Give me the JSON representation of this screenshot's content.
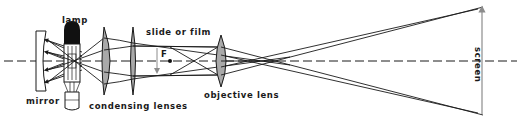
{
  "diagram": {
    "labels": {
      "lamp": "lamp",
      "mirror": "mirror",
      "condensing_lenses": "condensing lenses",
      "slide_or_film": "slide or film",
      "focal_point": "F",
      "objective_lens": "objective lens",
      "screen": "screen"
    },
    "components": [
      {
        "id": "mirror",
        "label": "mirror",
        "type": "concave-mirror"
      },
      {
        "id": "lamp",
        "label": "lamp",
        "type": "bulb"
      },
      {
        "id": "condensing-lens-1",
        "label": "condensing lenses",
        "type": "convex-lens"
      },
      {
        "id": "condensing-lens-2",
        "label": "condensing lenses",
        "type": "convex-lens"
      },
      {
        "id": "slide",
        "label": "slide or film",
        "type": "object-arrow"
      },
      {
        "id": "focal-point",
        "label": "F",
        "type": "point"
      },
      {
        "id": "objective-lens",
        "label": "objective lens",
        "type": "convex-lens"
      },
      {
        "id": "screen",
        "label": "screen",
        "type": "image-arrow"
      }
    ],
    "colors": {
      "line": "#1a1a1a",
      "lens_fill": "#a9a9a9",
      "arrow": "#8c8c8c",
      "background": "#ffffff"
    }
  }
}
